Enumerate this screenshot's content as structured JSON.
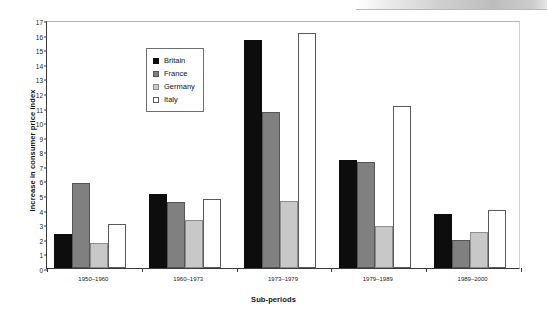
{
  "chart_data": {
    "type": "bar",
    "title": "",
    "xlabel": "Sub-periods",
    "ylabel": "Increase in consumer price index",
    "categories": [
      "1950–1960",
      "1960–1973",
      "1973–1979",
      "1979–1989",
      "1989–2000"
    ],
    "series": [
      {
        "name": "Britain",
        "color": "#0d0d0d",
        "values": [
          2.3,
          5.1,
          15.6,
          7.4,
          3.7
        ]
      },
      {
        "name": "France",
        "color": "#808080",
        "values": [
          5.8,
          4.5,
          10.7,
          7.3,
          1.9
        ]
      },
      {
        "name": "Germany",
        "color": "#c8c8c8",
        "values": [
          1.7,
          3.3,
          4.6,
          2.9,
          2.5
        ]
      },
      {
        "name": "Italy",
        "color": "#ffffff",
        "values": [
          3.0,
          4.7,
          16.1,
          11.1,
          4.0
        ]
      }
    ],
    "ylim": [
      0,
      17
    ],
    "ytick_labels": [
      "0",
      "1",
      "2",
      "3",
      "4",
      "5",
      "6",
      "7",
      "8",
      "9",
      "10",
      "11",
      "12",
      "13",
      "14",
      "15",
      "16",
      "17"
    ],
    "ytick_values": [
      0,
      1,
      2,
      3,
      4,
      5,
      6,
      7,
      8,
      9,
      10,
      11,
      12,
      13,
      14,
      15,
      16,
      17
    ],
    "grid": false,
    "legend_position": "upper-left-inside",
    "legend_entries": [
      "Britain",
      "France",
      "Germany",
      "Italy"
    ]
  }
}
